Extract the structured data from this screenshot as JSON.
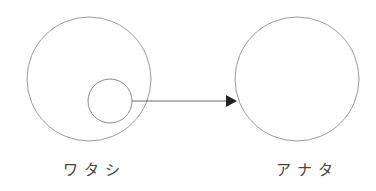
{
  "diagram": {
    "nodes": [
      {
        "id": "self",
        "label": "ワタシ",
        "cx": 89,
        "cy": 79,
        "r": 62
      },
      {
        "id": "other",
        "label": "アナタ",
        "cx": 297,
        "cy": 79,
        "r": 62
      }
    ],
    "inner_circle": {
      "parent": "self",
      "cx": 110,
      "cy": 101,
      "r": 22
    },
    "edge": {
      "from": "inner_circle",
      "to": "other",
      "x1": 132,
      "y1": 101,
      "x2": 236,
      "y2": 101
    },
    "colors": {
      "stroke": "#9a9a9a",
      "arrow": "#222222",
      "text": "#444444"
    }
  }
}
